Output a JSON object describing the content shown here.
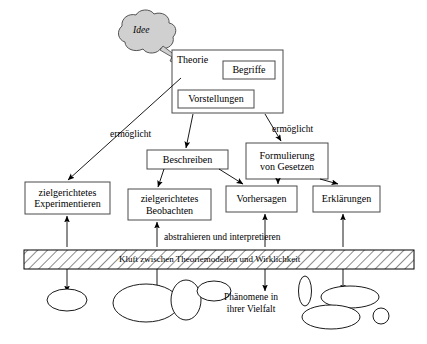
{
  "diagram": {
    "title_concept": "Kluft zwischen Theoriemodellen und Wirklichkeit",
    "cloud": {
      "label": "Idee",
      "fill": "#d0d0d0",
      "stroke": "#555555"
    },
    "boxes": {
      "theorie": {
        "label": "Theorie"
      },
      "begriffe": {
        "label": "Begriffe"
      },
      "vorstellungen": {
        "label": "Vorstellungen"
      },
      "beschreiben": {
        "label": "Beschreiben"
      },
      "formulierung": {
        "label": "Formulierung\nvon Gesetzen"
      },
      "experimentieren": {
        "label": "zielgerichtetes\nExperimentieren"
      },
      "beobachten": {
        "label": "zielgerichtetes\nBeobachten"
      },
      "vorhersagen": {
        "label": "Vorhersagen"
      },
      "erklaerungen": {
        "label": "Erklärungen"
      }
    },
    "edge_labels": {
      "ermoeglicht_left": "ermöglicht",
      "ermoeglicht_right": "ermöglicht",
      "abstrahieren": "abstrahieren und interpretieren"
    },
    "band": {
      "label": "Kluft zwischen Theoriemodellen und Wirklichkeit",
      "hatch_color": "#000000",
      "fill": "#ffffff"
    },
    "phenomena": {
      "label": "Phänomene  in\nihrer Vielfalt"
    },
    "colors": {
      "stroke": "#000000",
      "box_border": "#4a4a4a",
      "background": "#ffffff"
    }
  }
}
